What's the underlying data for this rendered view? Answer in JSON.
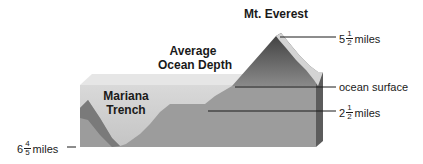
{
  "diagram": {
    "title_labels": {
      "everest": "Mt. Everest",
      "avg_depth_line1": "Average",
      "avg_depth_line2": "Ocean Depth",
      "trench_line1": "Mariana",
      "trench_line2": "Trench"
    },
    "measurements": {
      "everest_height": {
        "whole": "5",
        "num": "1",
        "den": "2",
        "unit": "miles"
      },
      "ocean_surface": "ocean surface",
      "average_depth": {
        "whole": "2",
        "num": "1",
        "den": "2",
        "unit": "miles"
      },
      "trench_depth": {
        "whole": "6",
        "num": "4",
        "den": "5",
        "unit": "miles"
      }
    },
    "colors": {
      "top_face": "#e4e4e4",
      "water": "#cfcfcf",
      "seafloor": "#9a9a9a",
      "side_face": "#5e5e5e",
      "mountain_dark": "#555555",
      "snow": "#d6d6d6",
      "line": "#1a1a1a"
    }
  }
}
